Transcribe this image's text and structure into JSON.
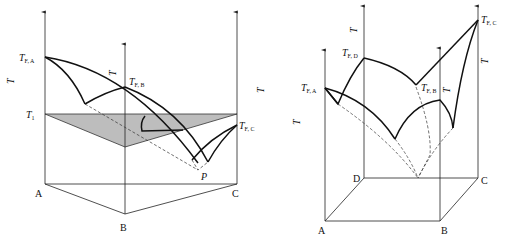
{
  "left_diagram": {
    "title": "Ternary eutectic phase diagram (triangular prism)",
    "axis_label": "T",
    "corners": [
      "A",
      "B",
      "C"
    ],
    "melting_points": {
      "a": {
        "main": "T",
        "sub": "F, A"
      },
      "b": {
        "main": "T",
        "sub": "F, B"
      },
      "c": {
        "main": "T",
        "sub": "F, C"
      }
    },
    "isotherm": {
      "main": "T",
      "sub": "1"
    },
    "eutectic_point": "P",
    "colors": {
      "isotherm_fill": "#bdbdbd",
      "line": "#111111"
    }
  },
  "right_diagram": {
    "title": "Quaternary eutectic phase diagram (square prism)",
    "axis_label": "T",
    "corners": [
      "A",
      "B",
      "C",
      "D"
    ],
    "melting_points": {
      "a": {
        "main": "T",
        "sub": "F, A"
      },
      "b": {
        "main": "T",
        "sub": "F, B"
      },
      "c": {
        "main": "T",
        "sub": "F, C"
      },
      "d": {
        "main": "T",
        "sub": "F, D"
      }
    }
  }
}
